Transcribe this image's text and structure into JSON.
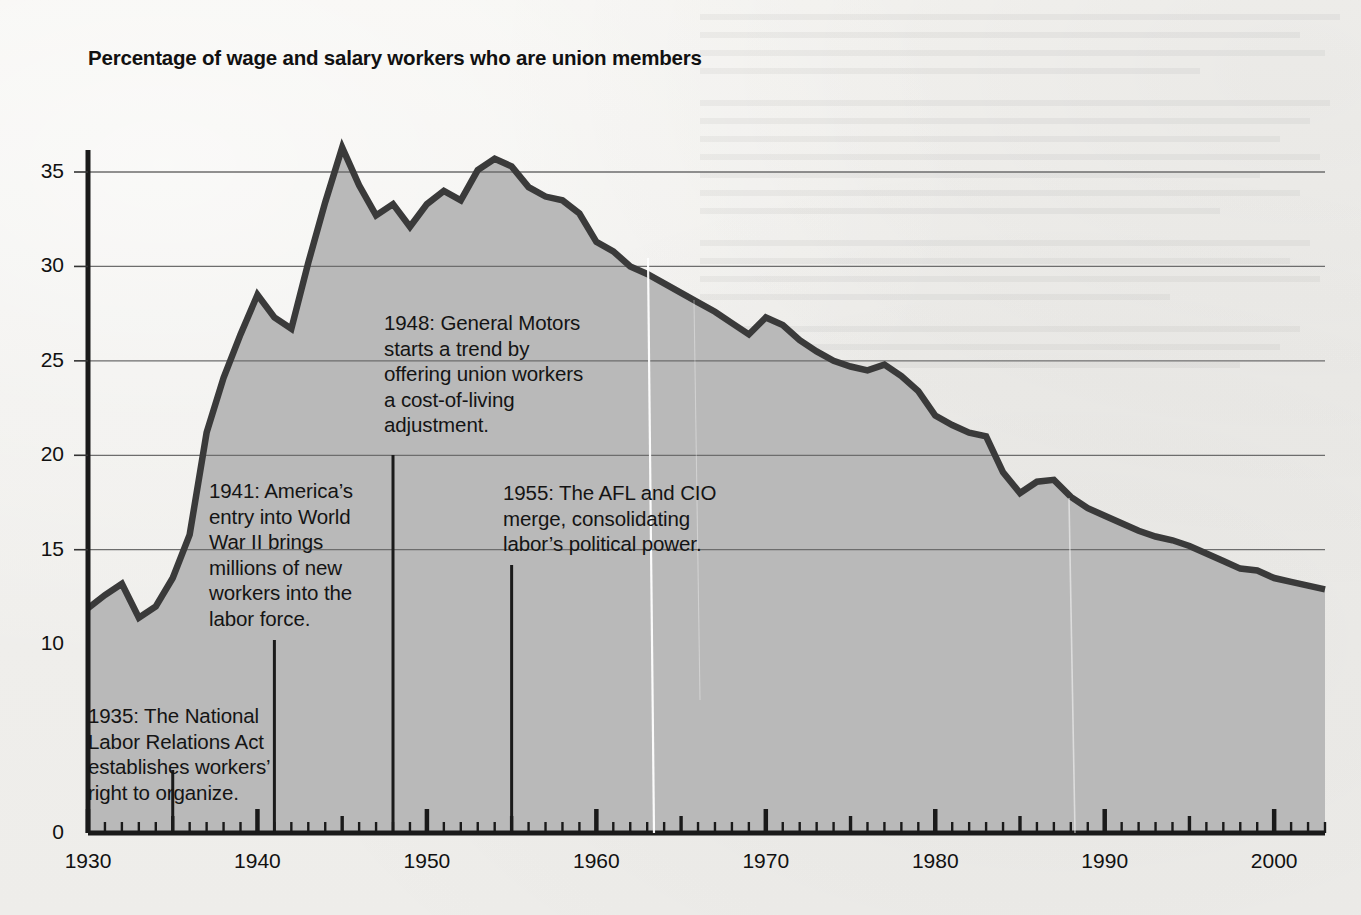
{
  "figure": {
    "title": "Percentage of wage and salary workers who are union members",
    "background_color": "#f1f0ed",
    "area_fill_color": "#b9b9b9",
    "line_color": "#3a3a3a",
    "grid_color": "#6d6d6d",
    "axis_color": "#1a1a1a",
    "text_color": "#141414"
  },
  "chart_data": {
    "type": "area",
    "title": "Percentage of wage and salary workers who are union members",
    "xlabel": "",
    "ylabel": "",
    "xlim": [
      1930,
      2003
    ],
    "ylim": [
      0,
      37.5
    ],
    "grid": true,
    "legend": "none",
    "x_tick_labels": [
      "1930",
      "1940",
      "1950",
      "1960",
      "1970",
      "1980",
      "1990",
      "2000"
    ],
    "x_tick_values": [
      1930,
      1940,
      1950,
      1960,
      1970,
      1980,
      1990,
      2000
    ],
    "x_minor_tick_interval": 1,
    "x_medium_tick_interval": 5,
    "y_tick_labels": [
      "0",
      "10",
      "15",
      "20",
      "25",
      "30",
      "35"
    ],
    "y_tick_values": [
      0,
      10,
      15,
      20,
      25,
      30,
      35
    ],
    "y_gridline_values": [
      15,
      20,
      25,
      30,
      35
    ],
    "series": [
      {
        "name": "Union membership rate",
        "units": "percent",
        "x": [
          1930,
          1931,
          1932,
          1933,
          1934,
          1935,
          1936,
          1937,
          1938,
          1939,
          1940,
          1941,
          1942,
          1943,
          1944,
          1945,
          1946,
          1947,
          1948,
          1949,
          1950,
          1951,
          1952,
          1953,
          1954,
          1955,
          1956,
          1957,
          1958,
          1959,
          1960,
          1961,
          1962,
          1963,
          1964,
          1965,
          1966,
          1967,
          1968,
          1969,
          1970,
          1971,
          1972,
          1973,
          1974,
          1975,
          1976,
          1977,
          1978,
          1979,
          1980,
          1981,
          1982,
          1983,
          1984,
          1985,
          1986,
          1987,
          1988,
          1989,
          1990,
          1991,
          1992,
          1993,
          1994,
          1995,
          1996,
          1997,
          1998,
          1999,
          2000,
          2001,
          2002,
          2003
        ],
        "values": [
          11.9,
          12.6,
          13.2,
          11.4,
          12.0,
          13.5,
          15.8,
          21.2,
          24.1,
          26.4,
          28.5,
          27.3,
          26.7,
          30.2,
          33.4,
          36.3,
          34.3,
          32.7,
          33.3,
          32.1,
          33.3,
          34.0,
          33.5,
          35.1,
          35.7,
          35.3,
          34.2,
          33.7,
          33.5,
          32.8,
          31.3,
          30.8,
          30.0,
          29.6,
          29.1,
          28.6,
          28.1,
          27.6,
          27.0,
          26.4,
          27.3,
          26.9,
          26.1,
          25.5,
          25.0,
          24.7,
          24.5,
          24.8,
          24.2,
          23.4,
          22.1,
          21.6,
          21.2,
          21.0,
          19.1,
          18.0,
          18.6,
          18.7,
          17.8,
          17.2,
          16.8,
          16.4,
          16.0,
          15.7,
          15.5,
          15.2,
          14.8,
          14.4,
          14.0,
          13.9,
          13.5,
          13.3,
          13.1,
          12.9
        ]
      }
    ]
  },
  "annotations": [
    {
      "id": "annot-1935",
      "year": 1935,
      "text": "1935: The National\nLabor Relations Act\nestablishes workers’\nright to organize."
    },
    {
      "id": "annot-1941",
      "year": 1941,
      "text": "1941: America’s\nentry into World\nWar II brings\nmillions of new\nworkers into the\nlabor force."
    },
    {
      "id": "annot-1948",
      "year": 1948,
      "text": "1948: General Motors\nstarts a trend by\noffering union workers\na cost-of-living\nadjustment."
    },
    {
      "id": "annot-1955",
      "year": 1955,
      "text": "1955: The AFL and CIO\nmerge, consolidating\nlabor’s political power."
    }
  ]
}
